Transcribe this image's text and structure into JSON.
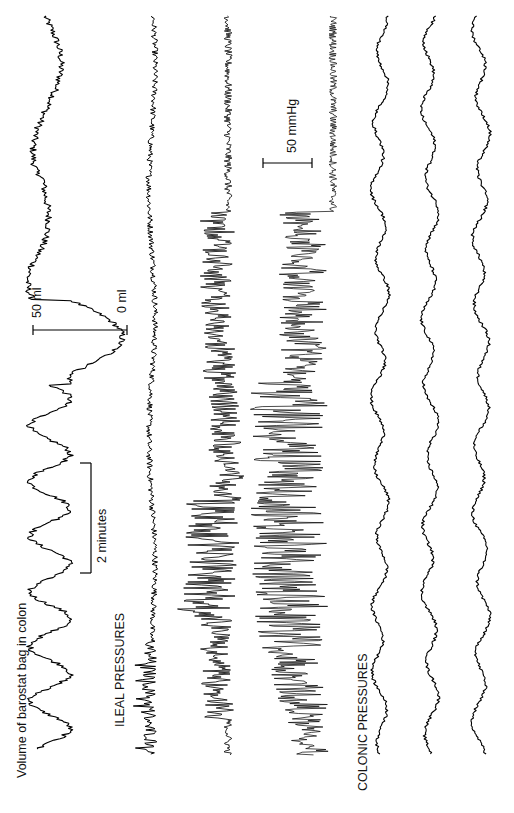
{
  "chart_data": {
    "type": "line",
    "orientation": "rotated-90-ccw (time runs bottom to top; signal amplitude horizontal, increases leftward)",
    "title": "",
    "labels": {
      "barostat": "Volume of barostat bag in colon",
      "ileal_group": "ILEAL PRESSURES",
      "colonic_group": "COLONIC PRESSURES"
    },
    "scale_bars": {
      "time": {
        "label": "2 minutes",
        "value_min": 2
      },
      "volume": {
        "label_top": "50 ml",
        "label_bottom": "0 ml",
        "value_ml": 50
      },
      "pressure": {
        "label": "50 mmHg",
        "value_mmHg": 50
      }
    },
    "xlabel": "Time (rotated axis)",
    "ylabel": "",
    "grid": false,
    "legend": "none",
    "series": [
      {
        "name": "Volume of barostat bag in colon",
        "group": "barostat",
        "units": "ml",
        "description": "Rhythmic volume oscillations (~1 cycle/min), large transient decrease toward 0 ml mid-record, then slower oscillations",
        "baseline_x": 55,
        "amplitude_px": 20,
        "cycle_px": 55
      },
      {
        "name": "Ileal pressure 1",
        "group": "ileal",
        "units": "mmHg",
        "description": "Low-amplitude baseline activity throughout",
        "baseline_x": 152,
        "amplitude_px": 6
      },
      {
        "name": "Ileal pressure 2",
        "group": "ileal",
        "units": "mmHg",
        "description": "Quiet baseline, then sustained burst of high-amplitude phasic contractions in lower two-thirds",
        "baseline_x": 228,
        "burst_amplitude_px": 55
      },
      {
        "name": "Ileal pressure 3",
        "group": "ileal",
        "units": "mmHg",
        "description": "Quiet baseline, then burst of very high-amplitude phasic contractions (migrating motor complex phase III-like)",
        "baseline_x": 333,
        "burst_amplitude_px": 85
      },
      {
        "name": "Colonic pressure 1",
        "group": "colonic",
        "units": "mmHg",
        "description": "Slow low-amplitude waves",
        "baseline_x": 380
      },
      {
        "name": "Colonic pressure 2",
        "group": "colonic",
        "units": "mmHg",
        "description": "Slow low-amplitude waves",
        "baseline_x": 430
      },
      {
        "name": "Colonic pressure 3",
        "group": "colonic",
        "units": "mmHg",
        "description": "Slow low-amplitude waves",
        "baseline_x": 481
      }
    ]
  }
}
